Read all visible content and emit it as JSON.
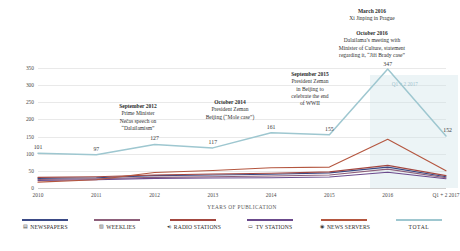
{
  "chart_data": {
    "type": "line",
    "title": "",
    "xlabel": "YEARS OF PUBLICATION",
    "ylabel": "NUMBER OF OUTPUTS",
    "categories": [
      "2010",
      "2011",
      "2012",
      "2013",
      "2014",
      "2015",
      "2016",
      "Q1 + 2 2017"
    ],
    "ylim": [
      0,
      350
    ],
    "yticks": [
      0,
      50,
      100,
      150,
      200,
      250,
      300,
      350
    ],
    "grid": true,
    "legend_position": "bottom",
    "series": [
      {
        "name": "NEWSPAPERS",
        "color": "#3b4a86",
        "icon": "newspaper-icon",
        "values": [
          28,
          30,
          36,
          38,
          40,
          44,
          61,
          33
        ]
      },
      {
        "name": "WEEKLIES",
        "color": "#8d5f7a",
        "icon": "weeklies-icon",
        "values": [
          25,
          27,
          31,
          33,
          35,
          38,
          55,
          30
        ]
      },
      {
        "name": "RADIO STATIONS",
        "color": "#a34740",
        "icon": "radio-icon",
        "values": [
          31,
          33,
          38,
          41,
          43,
          47,
          66,
          36
        ]
      },
      {
        "name": "TV STATIONS",
        "color": "#6b4a8c",
        "icon": "tv-icon",
        "values": [
          22,
          24,
          28,
          29,
          30,
          32,
          46,
          27
        ]
      },
      {
        "name": "NEWS SERVERS",
        "color": "#b4563f",
        "icon": "news-server-icon",
        "values": [
          17,
          24,
          45,
          51,
          59,
          61,
          142,
          50
        ]
      },
      {
        "name": "TOTAL",
        "color": "#9ec7d0",
        "icon": "total-icon",
        "values": [
          101,
          97,
          127,
          117,
          161,
          155,
          347,
          152
        ]
      }
    ],
    "data_labels": {
      "TOTAL": [
        "101",
        "97",
        "127",
        "117",
        "161",
        "155",
        "347",
        "152"
      ]
    },
    "highlight_band": {
      "label": "Q1 + 2 2017",
      "from": "2016",
      "to": "Q1 + 2 2017"
    },
    "annotations": [
      {
        "id": "sep-2012",
        "title": "September 2012",
        "body": "Prime Minister\nNečas speech on\n“Dalailamism”"
      },
      {
        "id": "oct-2014",
        "title": "October 2014",
        "body": "President Zeman\nBeijing (“Mole case”)"
      },
      {
        "id": "sep-2015",
        "title": "September 2015",
        "body": "President Zeman\nin Beijing to\ncelebrate the end\nof WWII"
      },
      {
        "id": "oct-2016",
        "title": "October 2016",
        "body": "Dalailama’s meeting with\nMinister of Culture, statement\nregarding it, “Jiří Brady case”"
      },
      {
        "id": "mar-2016",
        "title": "March 2016",
        "body": "Xi Jinping in Prague"
      }
    ]
  },
  "colors": {
    "newspapers": "#3b4a86",
    "weeklies": "#8d5f7a",
    "radio_stations": "#a34740",
    "tv_stations": "#6b4a8c",
    "news_servers": "#b4563f",
    "total": "#9ec7d0",
    "grid": "#e9e9e9",
    "band": "#cde2e7"
  },
  "legend": {
    "items": [
      {
        "label": "NEWSPAPERS",
        "glyph": "▤",
        "icon": "newspaper-icon"
      },
      {
        "label": "WEEKLIES",
        "glyph": "▨",
        "icon": "weeklies-icon"
      },
      {
        "label": "RADIO STATIONS",
        "glyph": "◂)",
        "icon": "radio-icon"
      },
      {
        "label": "TV STATIONS",
        "glyph": "▭",
        "icon": "tv-icon"
      },
      {
        "label": "NEWS SERVERS",
        "glyph": "◉",
        "icon": "news-server-icon"
      },
      {
        "label": "TOTAL",
        "glyph": "",
        "icon": "total-icon"
      }
    ]
  }
}
